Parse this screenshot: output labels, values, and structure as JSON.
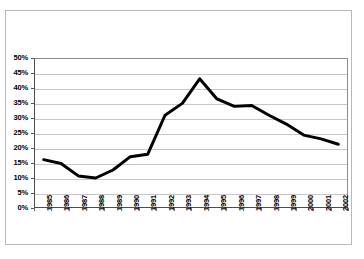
{
  "chart_data": {
    "type": "line",
    "title": "",
    "subtitle": "",
    "xlabel": "",
    "ylabel": "",
    "categories": [
      "1985",
      "1986",
      "1987",
      "1988",
      "1989",
      "1990",
      "1991",
      "1992",
      "1993",
      "1994",
      "1995",
      "1996",
      "1997",
      "1998",
      "1999",
      "2000",
      "2001",
      "2002"
    ],
    "values": [
      16.0,
      14.7,
      10.5,
      9.8,
      12.5,
      17.0,
      17.8,
      31.0,
      35.0,
      43.3,
      36.5,
      34.0,
      34.3,
      31.0,
      28.0,
      24.3,
      23.0,
      21.2
    ],
    "ylim": [
      0,
      50
    ],
    "y_ticks": [
      "0%",
      "5%",
      "10%",
      "15%",
      "20%",
      "25%",
      "30%",
      "35%",
      "40%",
      "45%",
      "50%"
    ],
    "y_tick_values": [
      0,
      5,
      10,
      15,
      20,
      25,
      30,
      35,
      40,
      45,
      50
    ],
    "grid": true,
    "legend": false,
    "legend_position": "none",
    "series_color": "#000000",
    "grid_color": "#c8c8c8",
    "axis_color": "#4d4d4d",
    "background_color": "#ffffff"
  }
}
